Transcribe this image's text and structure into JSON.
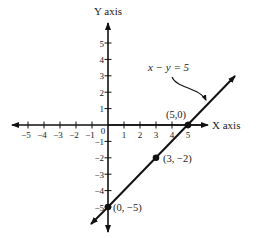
{
  "chart_data": {
    "type": "line",
    "title": "",
    "xlabel": "X axis",
    "ylabel": "Y axis",
    "xlim": [
      -5,
      5
    ],
    "ylim": [
      -5,
      5
    ],
    "x_ticks": [
      -5,
      -4,
      -3,
      -2,
      -1,
      0,
      1,
      2,
      3,
      4,
      5
    ],
    "y_ticks": [
      -5,
      -4,
      -3,
      -2,
      -1,
      1,
      2,
      3,
      4,
      5
    ],
    "x_tick_labels": [
      "−5",
      "−4",
      "−3",
      "−2",
      "−1",
      "0",
      "1",
      "2",
      "3",
      "4",
      "5"
    ],
    "y_tick_labels": [
      "−5",
      "−4",
      "−3",
      "−2",
      "−1",
      "1",
      "2",
      "3",
      "4",
      "5"
    ],
    "grid": false,
    "series": [
      {
        "name": "x − y = 5",
        "equation": "x - y = 5",
        "x": [
          0,
          3,
          5
        ],
        "y": [
          -5,
          -2,
          0
        ]
      }
    ],
    "points": [
      {
        "x": 5,
        "y": 0,
        "label": "(5,0)"
      },
      {
        "x": 3,
        "y": -2,
        "label": "(3, −2)"
      },
      {
        "x": 0,
        "y": -5,
        "label": "(0, −5)"
      }
    ],
    "annotations": [
      {
        "text": "x − y = 5",
        "target": "line",
        "arrow": "curved"
      }
    ],
    "color": "#111111"
  }
}
